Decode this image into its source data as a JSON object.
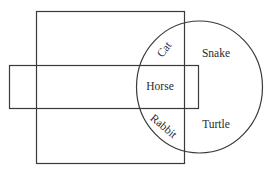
{
  "diagram": {
    "type": "venn",
    "sets": [
      {
        "name": "tall-rectangle",
        "shape": "rectangle"
      },
      {
        "name": "wide-rectangle",
        "shape": "rectangle"
      },
      {
        "name": "circle",
        "shape": "circle"
      }
    ],
    "regions": {
      "cat": "Cat",
      "horse": "Horse",
      "rabbit": "Rabbit",
      "snake": "Snake",
      "turtle": "Turtle"
    },
    "colors": {
      "stroke": "#3a3a3a",
      "text": "#2a2a2a",
      "background": "#ffffff"
    }
  }
}
